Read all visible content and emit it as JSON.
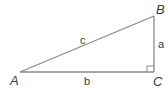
{
  "diagram": {
    "type": "right-triangle",
    "vertices": {
      "A": {
        "label": "A",
        "x": 20,
        "y": 72
      },
      "B": {
        "label": "B",
        "x": 154,
        "y": 16
      },
      "C": {
        "label": "C",
        "x": 154,
        "y": 72
      }
    },
    "sides": {
      "a": {
        "label": "a",
        "between": [
          "B",
          "C"
        ]
      },
      "b": {
        "label": "b",
        "between": [
          "A",
          "C"
        ]
      },
      "c": {
        "label": "c",
        "between": [
          "A",
          "B"
        ]
      }
    },
    "right_angle_at": "C",
    "colors": {
      "stroke": "#8a8a8a",
      "text": "#3a3a3a"
    }
  }
}
